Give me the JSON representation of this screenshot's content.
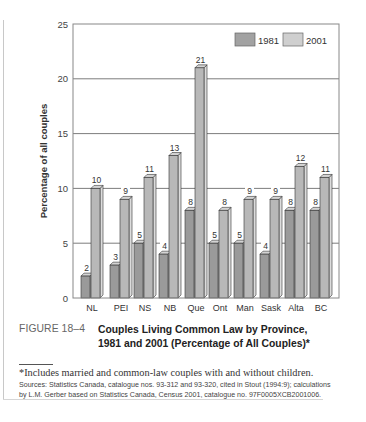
{
  "figure": {
    "label": "FIGURE 18–4",
    "title": "Couples Living Common Law by Province, 1981 and 2001 (Percentage of All Couples)*",
    "footnote": "*Includes married and common-law couples with and without children.",
    "sources": "Sources: Statistics Canada, catalogue nos. 93-312 and 93-320, cited in Stout (1994:9); calculations by L.M. Gerber based on Statistics Canada, Census 2001, catalogue no. 97F0005XCB2001006."
  },
  "colors": {
    "bar_1981_front": "#9a9a9a",
    "bar_1981_side": "#c8c8c8",
    "bar_2001_front": "#b8b8b8",
    "bar_2001_side": "#dcdcdc",
    "bar_top": "#d4d4d4",
    "grid": "#6e6e6e",
    "legend_1981": "#a2a2a2",
    "legend_2001": "#cfcfcf"
  },
  "chart_data": {
    "type": "bar",
    "title": "Couples Living Common Law by Province, 1981 and 2001 (Percentage of All Couples)*",
    "xlabel": "",
    "ylabel": "Percentage of all couples",
    "ylim": [
      0,
      25
    ],
    "yticks": [
      0,
      5,
      10,
      15,
      20,
      25
    ],
    "grid": true,
    "legend_position": "top-right",
    "categories": [
      "NL",
      "PEI",
      "NS",
      "NB",
      "Que",
      "Ont",
      "Man",
      "Sask",
      "Alta",
      "BC"
    ],
    "series": [
      {
        "name": "1981",
        "values": [
          2,
          3,
          5,
          4,
          8,
          5,
          5,
          4,
          8,
          8
        ]
      },
      {
        "name": "2001",
        "values": [
          10,
          9,
          11,
          13,
          21,
          8,
          9,
          9,
          12,
          11
        ]
      }
    ],
    "style": "3d-bar"
  }
}
